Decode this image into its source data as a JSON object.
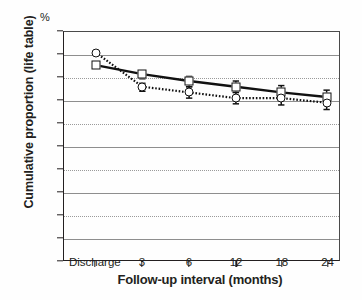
{
  "chart_data": {
    "type": "line",
    "title": "",
    "xlabel": "Follow-up interval (months)",
    "ylabel": "Cumulative proportion (life table)",
    "unit_label": "%",
    "categories": [
      "Discharge",
      "3",
      "6",
      "12",
      "18",
      "24"
    ],
    "ylim": [
      0,
      100
    ],
    "ytick_labels": [
      "0",
      "10",
      "20",
      "30",
      "40",
      "50",
      "60",
      "70",
      "80",
      "90",
      "100"
    ],
    "ytick_values": [
      0,
      10,
      20,
      30,
      40,
      50,
      60,
      70,
      80,
      90,
      100
    ],
    "grid": true,
    "legend": "none",
    "series": [
      {
        "name": "series-squares",
        "marker": "square",
        "line_style": "solid",
        "color": "#111111",
        "values": [
          85.5,
          81.5,
          78.5,
          76.0,
          73.5,
          71.5
        ],
        "error_bars": [
          {
            "lower": 85.5,
            "upper": 85.5
          },
          {
            "lower": 79.5,
            "upper": 83.0
          },
          {
            "lower": 76.0,
            "upper": 80.5
          },
          {
            "lower": 73.5,
            "upper": 78.5
          },
          {
            "lower": 70.5,
            "upper": 76.5
          },
          {
            "lower": 68.5,
            "upper": 74.5
          }
        ]
      },
      {
        "name": "series-circles",
        "marker": "circle",
        "line_style": "dotted",
        "color": "#111111",
        "values": [
          91.0,
          76.0,
          73.5,
          71.0,
          71.0,
          69.0
        ],
        "error_bars": [
          {
            "lower": 91.0,
            "upper": 91.0
          },
          {
            "lower": 74.0,
            "upper": 77.5
          },
          {
            "lower": 71.0,
            "upper": 76.0
          },
          {
            "lower": 68.5,
            "upper": 73.5
          },
          {
            "lower": 68.0,
            "upper": 73.5
          },
          {
            "lower": 66.0,
            "upper": 71.5
          }
        ]
      }
    ]
  }
}
